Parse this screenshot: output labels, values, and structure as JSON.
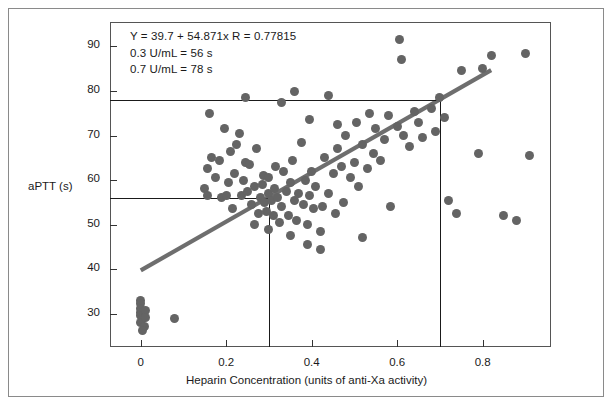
{
  "figure": {
    "caption_present": false,
    "background": "#ffffff",
    "border_color": "#8a8a8a",
    "point_color": "#646464",
    "line_color": "#6e6e6e",
    "axis_color": "#555555"
  },
  "annotation": {
    "line1": "Y = 39.7 + 54.871x   R = 0.77815",
    "line2": "0.3 U/mL = 56 s",
    "line3": "0.7 U/mL = 78 s"
  },
  "chart_data": {
    "type": "scatter",
    "title": "",
    "xlabel": "Heparin Concentration (units of anti-Xa activity)",
    "ylabel": "aPTT (s)",
    "xlim": [
      -0.072,
      0.96
    ],
    "ylim": [
      22.5,
      95.5
    ],
    "xticks": [
      0,
      0.2,
      0.4,
      0.6,
      0.8
    ],
    "xtick_labels": [
      "0",
      "0.2",
      "0.4",
      "0.6",
      "0.8"
    ],
    "yticks": [
      30,
      40,
      50,
      60,
      70,
      80,
      90
    ],
    "ytick_labels": [
      "30",
      "40",
      "50",
      "60",
      "70",
      "80",
      "90"
    ],
    "grid": false,
    "legend": "none",
    "regression": {
      "equation": "Y = 39.7 + 54.871x",
      "intercept": 39.7,
      "slope": 54.871,
      "r": 0.77815,
      "x_start": 0.0,
      "x_end": 0.82
    },
    "reference_lines": [
      {
        "orientation": "horizontal",
        "value": 78,
        "label": "0.7 U/mL = 78 s",
        "x_from": -0.072,
        "x_to": 0.7
      },
      {
        "orientation": "horizontal",
        "value": 56,
        "label": "0.3 U/mL = 56 s",
        "x_from": -0.072,
        "x_to": 0.3
      },
      {
        "orientation": "vertical",
        "value": 0.3,
        "label": "0.3 U/mL",
        "y_from": 22.5,
        "y_to": 56
      },
      {
        "orientation": "vertical",
        "value": 0.7,
        "label": "0.7 U/mL",
        "y_from": 22.5,
        "y_to": 78
      }
    ],
    "points": [
      [
        0.0,
        33.0
      ],
      [
        0.0,
        32.2
      ],
      [
        0.0,
        31.2
      ],
      [
        0.0,
        30.3
      ],
      [
        0.0,
        29.6
      ],
      [
        0.005,
        28.8
      ],
      [
        0.0,
        28.0
      ],
      [
        0.008,
        27.0
      ],
      [
        0.004,
        26.2
      ],
      [
        0.012,
        30.8
      ],
      [
        0.012,
        29.2
      ],
      [
        0.08,
        29.0
      ],
      [
        0.15,
        58.0
      ],
      [
        0.155,
        62.5
      ],
      [
        0.165,
        65.0
      ],
      [
        0.19,
        56.0
      ],
      [
        0.195,
        71.5
      ],
      [
        0.2,
        56.5
      ],
      [
        0.205,
        59.5
      ],
      [
        0.21,
        66.5
      ],
      [
        0.215,
        53.5
      ],
      [
        0.22,
        61.5
      ],
      [
        0.225,
        68.0
      ],
      [
        0.23,
        70.5
      ],
      [
        0.235,
        56.5
      ],
      [
        0.24,
        60.0
      ],
      [
        0.245,
        64.0
      ],
      [
        0.25,
        57.5
      ],
      [
        0.255,
        63.5
      ],
      [
        0.26,
        54.5
      ],
      [
        0.265,
        58.5
      ],
      [
        0.27,
        67.0
      ],
      [
        0.275,
        52.5
      ],
      [
        0.28,
        56.0
      ],
      [
        0.285,
        59.0
      ],
      [
        0.288,
        61.0
      ],
      [
        0.29,
        55.0
      ],
      [
        0.295,
        53.0
      ],
      [
        0.3,
        57.0
      ],
      [
        0.3,
        60.5
      ],
      [
        0.305,
        55.5
      ],
      [
        0.31,
        52.0
      ],
      [
        0.312,
        58.0
      ],
      [
        0.315,
        63.0
      ],
      [
        0.32,
        56.0
      ],
      [
        0.325,
        50.5
      ],
      [
        0.33,
        54.0
      ],
      [
        0.335,
        62.0
      ],
      [
        0.34,
        57.5
      ],
      [
        0.345,
        52.0
      ],
      [
        0.35,
        59.5
      ],
      [
        0.355,
        64.5
      ],
      [
        0.36,
        55.5
      ],
      [
        0.365,
        51.0
      ],
      [
        0.37,
        57.0
      ],
      [
        0.375,
        68.5
      ],
      [
        0.38,
        54.5
      ],
      [
        0.385,
        60.0
      ],
      [
        0.39,
        50.0
      ],
      [
        0.395,
        56.5
      ],
      [
        0.4,
        62.0
      ],
      [
        0.405,
        53.5
      ],
      [
        0.41,
        58.5
      ],
      [
        0.42,
        48.5
      ],
      [
        0.425,
        54.0
      ],
      [
        0.43,
        65.0
      ],
      [
        0.44,
        57.0
      ],
      [
        0.45,
        61.5
      ],
      [
        0.455,
        52.5
      ],
      [
        0.46,
        67.0
      ],
      [
        0.47,
        63.0
      ],
      [
        0.475,
        55.0
      ],
      [
        0.48,
        70.0
      ],
      [
        0.49,
        60.5
      ],
      [
        0.5,
        64.0
      ],
      [
        0.505,
        73.0
      ],
      [
        0.51,
        58.5
      ],
      [
        0.52,
        68.0
      ],
      [
        0.53,
        62.5
      ],
      [
        0.535,
        75.0
      ],
      [
        0.545,
        66.0
      ],
      [
        0.55,
        71.5
      ],
      [
        0.56,
        64.5
      ],
      [
        0.57,
        69.0
      ],
      [
        0.58,
        74.5
      ],
      [
        0.585,
        54.0
      ],
      [
        0.6,
        72.0
      ],
      [
        0.605,
        91.5
      ],
      [
        0.61,
        87.0
      ],
      [
        0.615,
        70.0
      ],
      [
        0.63,
        67.5
      ],
      [
        0.64,
        75.5
      ],
      [
        0.65,
        73.0
      ],
      [
        0.66,
        69.5
      ],
      [
        0.68,
        76.0
      ],
      [
        0.69,
        71.0
      ],
      [
        0.7,
        78.5
      ],
      [
        0.71,
        74.0
      ],
      [
        0.72,
        55.5
      ],
      [
        0.74,
        52.5
      ],
      [
        0.75,
        84.5
      ],
      [
        0.79,
        66.0
      ],
      [
        0.8,
        85.0
      ],
      [
        0.82,
        88.0
      ],
      [
        0.85,
        52.0
      ],
      [
        0.88,
        51.0
      ],
      [
        0.9,
        88.5
      ],
      [
        0.91,
        65.5
      ],
      [
        0.16,
        75.0
      ],
      [
        0.245,
        78.5
      ],
      [
        0.33,
        77.5
      ],
      [
        0.36,
        80.0
      ],
      [
        0.395,
        73.5
      ],
      [
        0.44,
        79.0
      ],
      [
        0.46,
        72.5
      ],
      [
        0.155,
        56.5
      ],
      [
        0.175,
        60.5
      ],
      [
        0.185,
        64.5
      ],
      [
        0.35,
        47.5
      ],
      [
        0.39,
        45.5
      ],
      [
        0.42,
        44.5
      ],
      [
        0.3,
        49.0
      ],
      [
        0.265,
        50.0
      ],
      [
        0.52,
        47.0
      ]
    ]
  }
}
